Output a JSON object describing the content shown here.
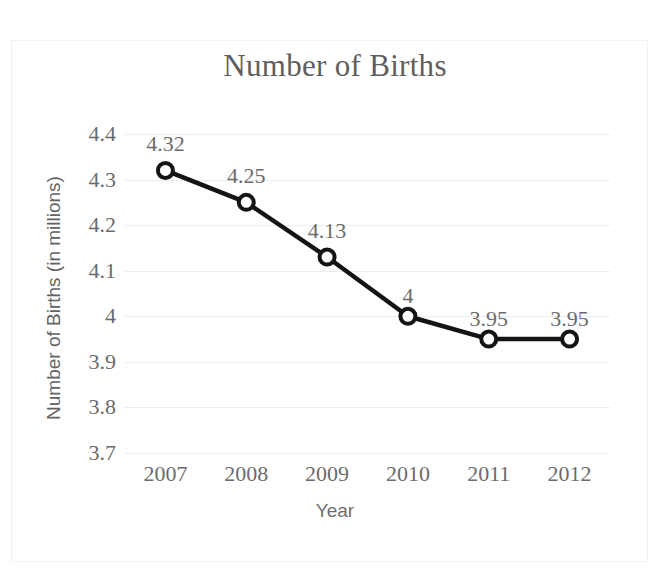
{
  "chart_data": {
    "type": "line",
    "title": "Number of Births",
    "xlabel": "Year",
    "ylabel": "Number of Births (in millions)",
    "categories": [
      "2007",
      "2008",
      "2009",
      "2010",
      "2011",
      "2012"
    ],
    "values": [
      4.32,
      4.25,
      4.13,
      4,
      3.95,
      3.95
    ],
    "point_labels": [
      "4.32",
      "4.25",
      "4.13",
      "4",
      "3.95",
      "3.95"
    ],
    "ylim": [
      3.7,
      4.4
    ],
    "y_ticks": [
      4.4,
      4.3,
      4.2,
      4.1,
      4,
      3.9,
      3.8,
      3.7
    ],
    "y_tick_labels": [
      "4.4",
      "4.3",
      "4.2",
      "4.1",
      "4",
      "3.9",
      "3.8",
      "3.7"
    ],
    "grid": true,
    "legend": "none",
    "series": [
      {
        "name": "Number of Births",
        "values": [
          4.32,
          4.25,
          4.13,
          4,
          3.95,
          3.95
        ]
      }
    ],
    "colors": {
      "line": "#141414",
      "marker_fill": "#ffffff",
      "marker_stroke": "#141414",
      "grid": "#ededed",
      "title_text": "#5e5e5e",
      "tick_text": "#6b6b6b",
      "axis_title_text": "#636363",
      "background": "#ffffff",
      "frame": "#f1f1f1"
    }
  }
}
